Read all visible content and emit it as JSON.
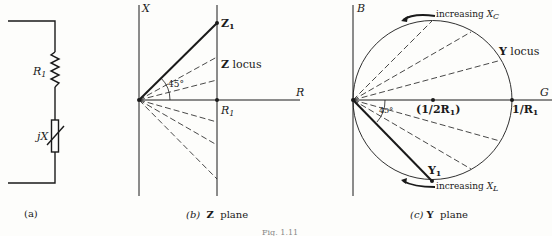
{
  "figure": {
    "caption": "Fig. 1.11",
    "panels": [
      {
        "id": "a",
        "caption": "(a)",
        "components": [
          {
            "type": "resistor",
            "label": "R",
            "subscript": "1"
          },
          {
            "type": "variable-reactance",
            "label": "jX"
          }
        ]
      },
      {
        "id": "b",
        "caption_letter": "(b)",
        "caption_symbol": "Z",
        "caption_text": "plane",
        "axis_vertical": "X",
        "axis_horizontal": "R",
        "point_label": "Z",
        "point_subscript": "1",
        "locus_symbol": "Z",
        "locus_text": "locus",
        "angle_label": "45°",
        "r1_label": "R",
        "r1_subscript": "1"
      },
      {
        "id": "c",
        "caption_letter": "(c)",
        "caption_symbol": "Y",
        "caption_text": "plane",
        "axis_vertical": "B",
        "axis_horizontal": "G",
        "point_label": "Y",
        "point_subscript": "1",
        "locus_symbol": "Y",
        "locus_text": "locus",
        "angle_label": "45°",
        "center_label": "(1/2R",
        "center_subscript": "1",
        "center_close": ")",
        "edge_label": "1/R",
        "edge_subscript": "1",
        "arrow_top_text": "increasing",
        "arrow_top_var": "X",
        "arrow_top_sub": "C",
        "arrow_bottom_text": "increasing",
        "arrow_bottom_var": "X",
        "arrow_bottom_sub": "L"
      }
    ]
  }
}
